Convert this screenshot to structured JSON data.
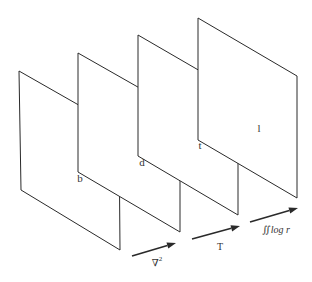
{
  "diagram": {
    "panels": [
      {
        "id": "b",
        "label": "b",
        "points": "19,71 119,128 120,250 21,190",
        "label_pos": [
          80,
          178
        ]
      },
      {
        "id": "d",
        "label": "d",
        "points": "78,53 180,111 180,232 78,172",
        "label_pos": [
          142,
          162
        ]
      },
      {
        "id": "t",
        "label": "t",
        "points": "138,35 238,93 238,215 138,156",
        "label_pos": [
          200,
          145
        ]
      },
      {
        "id": "l",
        "label": "l",
        "points": "198,18 297,76 297,198 198,140",
        "label_pos": [
          259,
          128
        ]
      }
    ],
    "arrows": [
      {
        "from": "b",
        "to": "d",
        "label": "∇",
        "sup": "2",
        "x1": 132,
        "y1": 256,
        "x2": 176,
        "y2": 243,
        "label_pos": [
          157,
          262
        ]
      },
      {
        "from": "d",
        "to": "t",
        "label": "T",
        "sup": "",
        "x1": 192,
        "y1": 239,
        "x2": 240,
        "y2": 226,
        "label_pos": [
          220,
          247
        ]
      },
      {
        "from": "t",
        "to": "l",
        "label": "∬log r",
        "sup": "",
        "x1": 250,
        "y1": 222,
        "x2": 298,
        "y2": 208,
        "label_pos": [
          276,
          230
        ]
      }
    ]
  }
}
